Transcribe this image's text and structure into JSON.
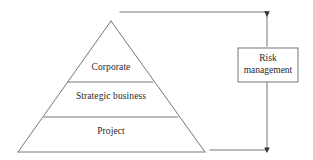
{
  "diagram": {
    "background_color": "#ffffff",
    "stroke_color": "#555555",
    "text_color": "#1f1f1f"
  },
  "pyramid": {
    "name": "risk-management-pyramid",
    "apex": {
      "x": 111,
      "y": 21
    },
    "base_left": {
      "x": 18,
      "y": 152
    },
    "base_right": {
      "x": 205,
      "y": 152
    },
    "dividers": [
      {
        "y": 82,
        "x1": 68,
        "x2": 153
      },
      {
        "y": 117,
        "x1": 44,
        "x2": 178
      }
    ],
    "layers": [
      {
        "id": "corporate",
        "label": "Corporate",
        "order": 1
      },
      {
        "id": "strategic-business",
        "label": "Strategic business",
        "order": 2
      },
      {
        "id": "project",
        "label": "Project",
        "order": 3
      }
    ]
  },
  "side_box": {
    "name": "risk-management-box",
    "label_line_1": "Risk",
    "label_line_2": "management",
    "x": 238,
    "y": 48,
    "width": 60,
    "height": 34
  },
  "connectors": {
    "top": {
      "name": "top-connector",
      "from": {
        "x": 120,
        "y": 12
      },
      "to": {
        "x": 267,
        "y": 12
      },
      "arrow": "down"
    },
    "bottom": {
      "name": "bottom-connector",
      "from": {
        "x": 210,
        "y": 150
      },
      "to": {
        "x": 267,
        "y": 150
      },
      "arrow": "down"
    },
    "vertical_upper": {
      "x": 267,
      "y1": 12,
      "y2": 48
    },
    "vertical_lower": {
      "x": 267,
      "y1": 82,
      "y2": 150
    }
  }
}
